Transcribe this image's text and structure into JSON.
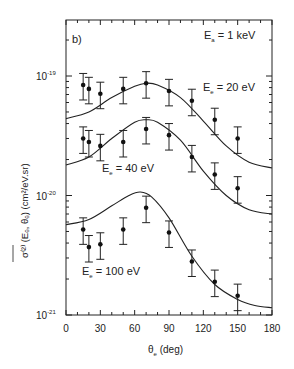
{
  "chart_data": {
    "type": "scatter",
    "panel_label": "b)",
    "title": "",
    "annotation": "E_a = 1 keV",
    "xlabel": "θ_e (deg)",
    "ylabel": "σ̄^(2) (E_e, θ_e) (cm²/eV.sr)",
    "xlim": [
      0,
      180
    ],
    "ylim": [
      1e-21,
      3e-19
    ],
    "yscale": "log",
    "x_ticks": [
      0,
      30,
      60,
      90,
      120,
      150,
      180
    ],
    "x_tick_labels": [
      "0",
      "30",
      "60",
      "90",
      "120",
      "150",
      "180"
    ],
    "y_ticks": [
      1e-21,
      1e-20,
      1e-19
    ],
    "y_tick_labels": [
      "10^-21",
      "10^-20",
      "10^-19"
    ],
    "grid": false,
    "legend": null,
    "series": [
      {
        "name": "E_e = 20 eV",
        "label_text": "E_e = 20 eV",
        "points": {
          "x": [
            15,
            20,
            30,
            50,
            70,
            90,
            110,
            130,
            150
          ],
          "y": [
            8.4e-20,
            7.8e-20,
            7.1e-20,
            7.8e-20,
            8.7e-20,
            7.5e-20,
            6.2e-20,
            4.3e-20,
            3e-20
          ],
          "error_frac": 0.25
        },
        "curve": {
          "x": [
            0,
            20,
            40,
            60,
            70,
            80,
            100,
            120,
            140,
            160,
            180
          ],
          "y": [
            4.4e-20,
            5e-20,
            6.6e-20,
            8.2e-20,
            8.7e-20,
            8.4e-20,
            6.6e-20,
            4.2e-20,
            2.6e-20,
            1.9e-20,
            1.7e-20
          ]
        }
      },
      {
        "name": "E_e = 40 eV",
        "label_text": "E_e = 40 eV",
        "points": {
          "x": [
            15,
            20,
            30,
            50,
            70,
            90,
            110,
            130,
            150
          ],
          "y": [
            3e-20,
            2.8e-20,
            2.6e-20,
            2.8e-20,
            3.6e-20,
            3.2e-20,
            2.1e-20,
            1.5e-20,
            1.15e-20
          ],
          "error_frac": 0.25
        },
        "curve": {
          "x": [
            0,
            20,
            40,
            60,
            70,
            80,
            100,
            120,
            140,
            160,
            180
          ],
          "y": [
            1.8e-20,
            2.1e-20,
            3e-20,
            4.1e-20,
            4.3e-20,
            4.1e-20,
            2.9e-20,
            1.6e-20,
            1e-20,
            7.6e-21,
            7e-21
          ]
        }
      },
      {
        "name": "E_e = 100 eV",
        "label_text": "E_e = 100 eV",
        "points": {
          "x": [
            15,
            20,
            30,
            50,
            70,
            90,
            110,
            130,
            150
          ],
          "y": [
            5.2e-21,
            3.7e-21,
            3.9e-21,
            5.2e-21,
            7.9e-21,
            4.9e-21,
            2.8e-21,
            1.9e-21,
            1.45e-21
          ],
          "error_frac": 0.25
        },
        "curve": {
          "x": [
            0,
            20,
            40,
            55,
            65,
            75,
            90,
            110,
            130,
            150,
            165,
            180
          ],
          "y": [
            5.7e-21,
            6.3e-21,
            8.2e-21,
            1e-20,
            1.07e-20,
            9.7e-21,
            6.5e-21,
            3.1e-21,
            1.8e-21,
            1.35e-21,
            1.2e-21,
            1.15e-21
          ]
        }
      }
    ]
  },
  "labels": {
    "panel": "b)",
    "beam_energy": "E",
    "beam_energy_sub": "a",
    "beam_energy_val": " = 1 keV",
    "e20": "E",
    "e20_sub": "e",
    "e20_val": " = 20 eV",
    "e40": "E",
    "e40_sub": "e",
    "e40_val": " = 40 eV",
    "e100": "E",
    "e100_sub": "e",
    "e100_val": " = 100 eV",
    "xlabel_theta": "θ",
    "xlabel_sub": "e",
    "xlabel_unit": " (deg)",
    "ylabel": "σ⁽²⁾ (Eₑ, θₑ) (cm²/eV.sr)",
    "ytick_m19": "10",
    "ytick_m19_exp": "-19",
    "ytick_m20": "10",
    "ytick_m20_exp": "-20",
    "ytick_m21": "10",
    "ytick_m21_exp": "-21"
  }
}
